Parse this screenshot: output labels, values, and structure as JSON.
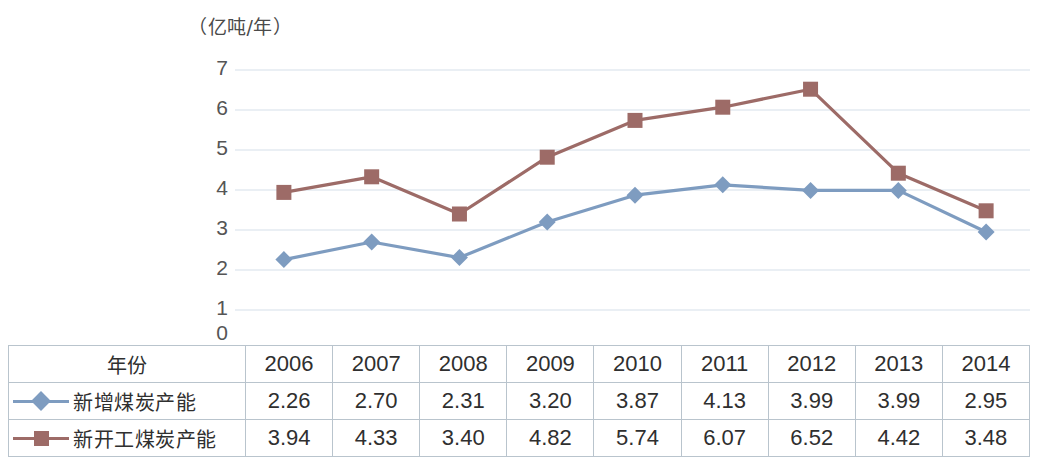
{
  "axis": {
    "unit_label": "（亿吨/年）",
    "yticks": [
      "7",
      "6",
      "5",
      "4",
      "3",
      "2",
      "1",
      "0"
    ]
  },
  "table": {
    "header_label": "年份",
    "years": [
      "2006",
      "2007",
      "2008",
      "2009",
      "2010",
      "2011",
      "2012",
      "2013",
      "2014"
    ],
    "rows": [
      {
        "name": "新增煤炭产能",
        "marker": "diamond-marker",
        "color": "#7e9cc0",
        "values": [
          "2.26",
          "2.70",
          "2.31",
          "3.20",
          "3.87",
          "4.13",
          "3.99",
          "3.99",
          "2.95"
        ]
      },
      {
        "name": "新开工煤炭产能",
        "marker": "square-marker",
        "color": "#9d6b67",
        "values": [
          "3.94",
          "4.33",
          "3.40",
          "4.82",
          "5.74",
          "6.07",
          "6.52",
          "4.42",
          "3.48"
        ]
      }
    ]
  },
  "chart_data": {
    "type": "line",
    "title": "",
    "xlabel": "",
    "ylabel": "（亿吨/年）",
    "categories": [
      "2006",
      "2007",
      "2008",
      "2009",
      "2010",
      "2011",
      "2012",
      "2013",
      "2014"
    ],
    "ylim": [
      0,
      7
    ],
    "yticks": [
      0,
      1,
      2,
      3,
      4,
      5,
      6,
      7
    ],
    "grid": "horizontal",
    "legend_position": "table-row-labels",
    "series": [
      {
        "name": "新增煤炭产能",
        "color": "#7e9cc0",
        "marker": "diamond",
        "values": [
          2.26,
          2.7,
          2.31,
          3.2,
          3.87,
          4.13,
          3.99,
          3.99,
          2.95
        ]
      },
      {
        "name": "新开工煤炭产能",
        "color": "#9d6b67",
        "marker": "square",
        "values": [
          3.94,
          4.33,
          3.4,
          4.82,
          5.74,
          6.07,
          6.52,
          4.42,
          3.48
        ]
      }
    ]
  },
  "style": {
    "gridline_color": "#e3eaf0",
    "table_border_color": "#b9c4cd"
  }
}
